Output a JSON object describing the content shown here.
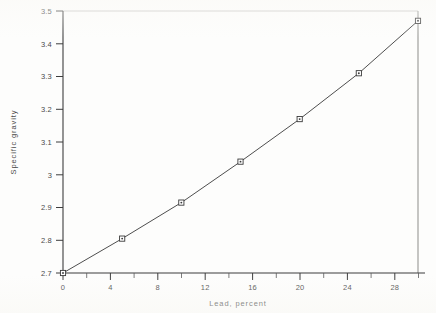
{
  "chart_data": {
    "type": "line",
    "title": "",
    "subtitle": "",
    "xlabel": "Lead, percent",
    "ylabel": "Specific gravity",
    "xlim": [
      0,
      30
    ],
    "ylim": [
      2.7,
      3.5
    ],
    "grid": false,
    "legend": false,
    "legend_position": "none",
    "marker": "square-with-center-dot",
    "line_color": "#4e4e4e",
    "marker_face_color": "#ffffff",
    "marker_edge_color": "#3a3a3a",
    "x": [
      0,
      5,
      10,
      15,
      20,
      25,
      30
    ],
    "values": [
      2.7,
      2.805,
      2.915,
      3.04,
      3.17,
      3.31,
      3.47
    ],
    "series": [
      {
        "name": "Specific gravity vs lead content",
        "x": [
          0,
          5,
          10,
          15,
          20,
          25,
          30
        ],
        "values": [
          2.7,
          2.805,
          2.915,
          3.04,
          3.17,
          3.31,
          3.47
        ]
      }
    ],
    "x_major_ticks": [
      0,
      4,
      8,
      12,
      16,
      20,
      24,
      28
    ],
    "x_major_tick_labels": [
      "0",
      "4",
      "8",
      "12",
      "16",
      "20",
      "24",
      "28"
    ],
    "x_minor_ticks": [
      2,
      6,
      10,
      14,
      18,
      22,
      26,
      30
    ],
    "y_major_ticks": [
      2.7,
      2.8,
      2.9,
      3.0,
      3.1,
      3.2,
      3.3,
      3.4,
      3.5
    ],
    "y_major_tick_labels": [
      "2.7",
      "2.8",
      "2.9",
      "3",
      "3.1",
      "3.2",
      "3.3",
      "3.4",
      "3.5"
    ],
    "annotations": []
  },
  "figure": {
    "background_color": "#fdfdfc",
    "axis_color": "#3d3d3d",
    "top_border_color": "#c9c9c6",
    "right_border_color": "#8d8d8a"
  }
}
